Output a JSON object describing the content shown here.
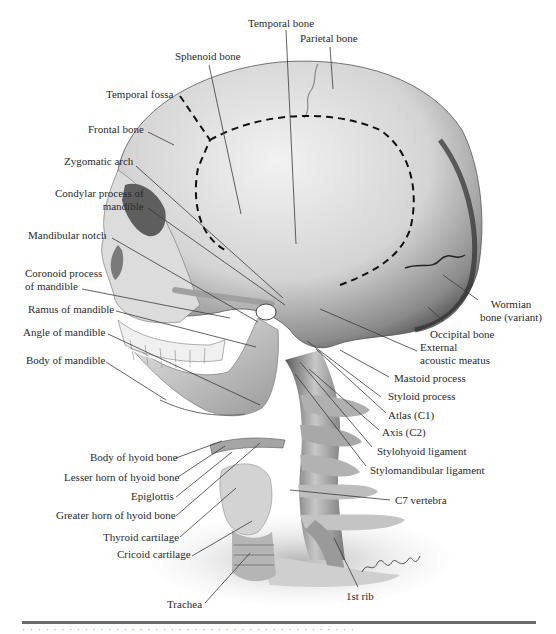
{
  "figure": {
    "type": "anatomical-illustration",
    "colors": {
      "bone_light": "#e6e6e6",
      "bone_mid": "#b5b5b5",
      "bone_dark": "#4a4a4a",
      "label_text": "#2a2a2a",
      "leader_line": "#3a3a3a",
      "dashed_outline": "#111111",
      "rule": "#6b6b6b"
    },
    "labels": [
      {
        "id": "temporal-bone",
        "text": "Temporal bone",
        "x": 248,
        "y": 17,
        "align": "left",
        "line": [
          286,
          30,
          296,
          244
        ]
      },
      {
        "id": "parietal-bone",
        "text": "Parietal bone",
        "x": 300,
        "y": 32,
        "align": "left",
        "line": [
          330,
          47,
          333,
          89
        ]
      },
      {
        "id": "sphenoid-bone",
        "text": "Sphenoid bone",
        "x": 175,
        "y": 50,
        "align": "left",
        "line": [
          209,
          65,
          241,
          214
        ]
      },
      {
        "id": "temporal-fossa",
        "text": "Temporal fossa",
        "x": 106,
        "y": 88,
        "align": "left",
        "line": null
      },
      {
        "id": "frontal-bone",
        "text": "Frontal bone",
        "x": 88,
        "y": 123,
        "align": "left",
        "line": [
          148,
          132,
          174,
          145
        ]
      },
      {
        "id": "zygomatic-arch",
        "text": "Zygomatic arch",
        "x": 64,
        "y": 155,
        "align": "left",
        "line": [
          136,
          166,
          283,
          298
        ]
      },
      {
        "id": "condylar-process",
        "text": "Condylar process of",
        "text2": "mandible",
        "x": 55,
        "y": 187,
        "align": "right",
        "line": [
          148,
          208,
          285,
          305
        ]
      },
      {
        "id": "mandibular-notch",
        "text": "Mandibular notch",
        "x": 28,
        "y": 229,
        "align": "left",
        "line": [
          112,
          238,
          258,
          322
        ]
      },
      {
        "id": "coronoid-process",
        "text": "Coronoid process",
        "text2": "of mandible",
        "x": 25,
        "y": 267,
        "align": "left",
        "line": [
          82,
          289,
          230,
          318
        ]
      },
      {
        "id": "ramus-mandible",
        "text": "Ramus of mandible",
        "x": 28,
        "y": 303,
        "align": "left",
        "line": [
          116,
          311,
          256,
          347
        ]
      },
      {
        "id": "angle-mandible",
        "text": "Angle of mandible",
        "x": 23,
        "y": 326,
        "align": "left",
        "line": [
          108,
          334,
          260,
          405
        ]
      },
      {
        "id": "body-mandible",
        "text": "Body of mandible",
        "x": 26,
        "y": 354,
        "align": "left",
        "line": [
          106,
          362,
          166,
          400
        ]
      },
      {
        "id": "wormian-bone",
        "text": "Wormian",
        "text2": "bone (variant)",
        "x": 480,
        "y": 298,
        "align": "center",
        "line": [
          478,
          300,
          443,
          275
        ]
      },
      {
        "id": "occipital-bone",
        "text": "Occipital bone",
        "x": 430,
        "y": 328,
        "align": "left",
        "line": [
          443,
          321,
          428,
          307
        ]
      },
      {
        "id": "external-acoustic-meatus",
        "text": "External",
        "text2": "acoustic meatus",
        "x": 420,
        "y": 341,
        "align": "left",
        "line": [
          417,
          351,
          320,
          309
        ]
      },
      {
        "id": "mastoid-process",
        "text": "Mastoid process",
        "x": 394,
        "y": 372,
        "align": "left",
        "line": [
          389,
          377,
          340,
          350
        ]
      },
      {
        "id": "styloid-process",
        "text": "Styloid process",
        "x": 388,
        "y": 390,
        "align": "left",
        "line": [
          381,
          397,
          307,
          341
        ]
      },
      {
        "id": "atlas",
        "text": "Atlas (C1)",
        "x": 388,
        "y": 409,
        "align": "left",
        "line": [
          386,
          413,
          316,
          349
        ]
      },
      {
        "id": "axis",
        "text": "Axis (C2)",
        "x": 382,
        "y": 426,
        "align": "left",
        "line": [
          379,
          430,
          309,
          369
        ]
      },
      {
        "id": "stylohyoid-ligament",
        "text": "Stylohyoid ligament",
        "x": 377,
        "y": 445,
        "align": "left",
        "line": [
          372,
          447,
          300,
          362
        ]
      },
      {
        "id": "stylomandibular-ligament",
        "text": "Stylomandibular ligament",
        "x": 370,
        "y": 464,
        "align": "left",
        "line": [
          366,
          466,
          295,
          374
        ]
      },
      {
        "id": "c7-vertebra",
        "text": "C7 vertebra",
        "x": 395,
        "y": 494,
        "align": "left",
        "line": [
          390,
          500,
          290,
          490
        ]
      },
      {
        "id": "body-hyoid",
        "text": "Body of hyoid bone",
        "x": 90,
        "y": 451,
        "align": "left",
        "line": [
          176,
          458,
          222,
          441
        ]
      },
      {
        "id": "lesser-horn-hyoid",
        "text": "Lesser horn of hyoid bone",
        "x": 64,
        "y": 471,
        "align": "left",
        "line": [
          178,
          477,
          225,
          446
        ]
      },
      {
        "id": "epiglottis",
        "text": "Epiglottis",
        "x": 131,
        "y": 490,
        "align": "left",
        "line": [
          176,
          497,
          232,
          452
        ]
      },
      {
        "id": "greater-horn-hyoid",
        "text": "Greater horn of hyoid bone",
        "x": 56,
        "y": 509,
        "align": "left",
        "line": [
          176,
          516,
          260,
          443
        ]
      },
      {
        "id": "thyroid-cartilage",
        "text": "Thyroid cartilage",
        "x": 103,
        "y": 531,
        "align": "left",
        "line": [
          180,
          537,
          236,
          488
        ]
      },
      {
        "id": "cricoid-cartilage",
        "text": "Cricoid cartilage",
        "x": 117,
        "y": 548,
        "align": "left",
        "line": [
          192,
          556,
          252,
          521
        ]
      },
      {
        "id": "trachea",
        "text": "Trachea",
        "x": 167,
        "y": 598,
        "align": "left",
        "line": [
          205,
          603,
          250,
          553
        ]
      },
      {
        "id": "first-rib",
        "text": "1st rib",
        "x": 346,
        "y": 590,
        "align": "left",
        "line": [
          358,
          587,
          334,
          538
        ]
      }
    ],
    "signature": "Christopher M. Smith",
    "caption_cropped": "(caption text cut off at bottom edge)"
  }
}
